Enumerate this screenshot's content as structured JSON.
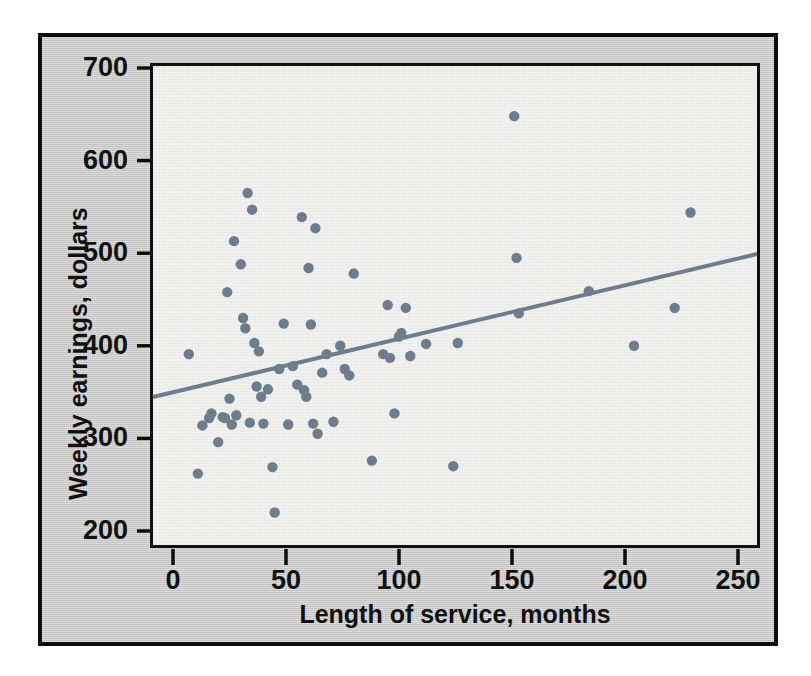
{
  "chart_data": {
    "type": "scatter",
    "title": "",
    "xlabel": "Length of service, months",
    "ylabel": "Weekly earnings, dollars",
    "xlim": [
      -10,
      260
    ],
    "ylim": [
      185,
      715
    ],
    "xticks": [
      0,
      50,
      100,
      150,
      200,
      250
    ],
    "yticks": [
      200,
      300,
      400,
      500,
      600,
      700
    ],
    "grid": false,
    "legend": null,
    "marker_color": "#6e7d8c",
    "line_color": "#6e7d8c",
    "plot_bg": "#f1f1ef",
    "panel_bg": "#c9c9c9",
    "frame_color": "#0d0d0d",
    "points": [
      [
        7,
        391
      ],
      [
        11,
        262
      ],
      [
        13,
        314
      ],
      [
        16,
        322
      ],
      [
        17,
        327
      ],
      [
        20,
        296
      ],
      [
        22,
        323
      ],
      [
        23,
        322
      ],
      [
        24,
        458
      ],
      [
        25,
        343
      ],
      [
        26,
        315
      ],
      [
        27,
        513
      ],
      [
        28,
        325
      ],
      [
        30,
        488
      ],
      [
        31,
        430
      ],
      [
        32,
        419
      ],
      [
        33,
        565
      ],
      [
        34,
        317
      ],
      [
        35,
        547
      ],
      [
        36,
        403
      ],
      [
        37,
        356
      ],
      [
        38,
        394
      ],
      [
        39,
        345
      ],
      [
        40,
        316
      ],
      [
        42,
        353
      ],
      [
        44,
        269
      ],
      [
        45,
        220
      ],
      [
        47,
        375
      ],
      [
        49,
        424
      ],
      [
        51,
        315
      ],
      [
        53,
        378
      ],
      [
        55,
        358
      ],
      [
        57,
        539
      ],
      [
        58,
        352
      ],
      [
        59,
        345
      ],
      [
        60,
        484
      ],
      [
        61,
        423
      ],
      [
        62,
        316
      ],
      [
        63,
        527
      ],
      [
        64,
        305
      ],
      [
        66,
        371
      ],
      [
        68,
        391
      ],
      [
        71,
        318
      ],
      [
        74,
        400
      ],
      [
        76,
        375
      ],
      [
        78,
        368
      ],
      [
        80,
        478
      ],
      [
        88,
        276
      ],
      [
        93,
        391
      ],
      [
        95,
        444
      ],
      [
        96,
        387
      ],
      [
        98,
        327
      ],
      [
        100,
        410
      ],
      [
        101,
        414
      ],
      [
        103,
        441
      ],
      [
        105,
        389
      ],
      [
        112,
        402
      ],
      [
        124,
        270
      ],
      [
        126,
        403
      ],
      [
        151,
        648
      ],
      [
        152,
        495
      ],
      [
        153,
        435
      ],
      [
        184,
        459
      ],
      [
        204,
        400
      ],
      [
        222,
        441
      ],
      [
        229,
        544
      ]
    ],
    "trendline": {
      "label": "least-squares regression line",
      "x": [
        -10,
        260
      ],
      "y": [
        344,
        500
      ]
    }
  },
  "figure": {
    "x_tick_labels": [
      "0",
      "50",
      "100",
      "150",
      "200",
      "250"
    ],
    "y_tick_labels": [
      "200",
      "300",
      "400",
      "500",
      "600",
      "700"
    ]
  }
}
